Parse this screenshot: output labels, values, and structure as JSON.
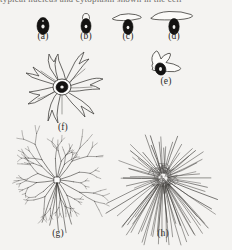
{
  "figure": {
    "title_clipped": "typical          nucleus and cytoplasm shown in the cell",
    "background_color": "#f4f3f1",
    "ink_color": "#3a3835",
    "nucleus_color": "#141312",
    "panel_count": 8
  },
  "panels": [
    {
      "id": "a",
      "label": "(a)",
      "caption_label": "(a)",
      "shape": "round-cell",
      "stage": "rounded cell, no protrusions",
      "cx": 43,
      "cy": 26,
      "label_x": 43,
      "label_y": 36
    },
    {
      "id": "b",
      "label": "(b)",
      "caption_label": "(b)",
      "shape": "small-bleb-cell",
      "stage": "cell with small apical bleb",
      "cx": 86,
      "cy": 26,
      "label_x": 86,
      "label_y": 36
    },
    {
      "id": "c",
      "label": "(c)",
      "caption_label": "(c)",
      "shape": "narrow-veil-cell",
      "stage": "cell with narrow lamellipodial veil",
      "cx": 128,
      "cy": 26,
      "label_x": 128,
      "label_y": 36
    },
    {
      "id": "d",
      "label": "(d)",
      "caption_label": "(d)",
      "shape": "broad-veil-cell",
      "stage": "cell with broad lamellipodial veil",
      "cx": 174,
      "cy": 25,
      "label_x": 174,
      "label_y": 36
    },
    {
      "id": "e",
      "label": "(e)",
      "caption_label": "(e)",
      "shape": "bipolar-veil-cell",
      "stage": "bipolar spreading cell",
      "cx": 166,
      "cy": 66,
      "label_x": 166,
      "label_y": 88
    },
    {
      "id": "f",
      "label": "(f)",
      "caption_label": "(f)",
      "shape": "stellate-cell",
      "stage": "stellate cell with thick pseudopodia",
      "cx": 62,
      "cy": 87,
      "label_x": 62,
      "label_y": 130
    },
    {
      "id": "g",
      "label": "(g)",
      "caption_label": "(g)",
      "shape": "branched-arbor",
      "stage": "cell with fine branched processes",
      "cx": 57,
      "cy": 180,
      "label_x": 57,
      "label_y": 238
    },
    {
      "id": "h",
      "label": "(h)",
      "caption_label": "(h)",
      "shape": "dense-radial-arbor",
      "stage": "dense radiating arbor of fine processes",
      "cx": 163,
      "cy": 180,
      "label_x": 163,
      "label_y": 238
    }
  ]
}
